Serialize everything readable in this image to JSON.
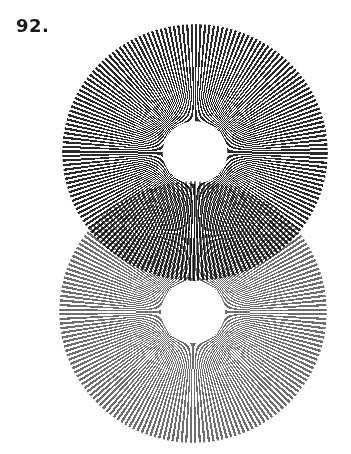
{
  "figure": {
    "number_label": "92.",
    "upper_disc": {
      "pattern": "radial-spokes",
      "spoke_count": 180,
      "color": "#2a2a2a",
      "center": [
        195,
        152
      ],
      "outer_radius": 131,
      "hole_radius": 31
    },
    "lower_disc": {
      "pattern": "radial-spokes",
      "spoke_count": 180,
      "color": "#6e6e6e",
      "center": [
        193,
        312
      ],
      "outer_radius": 132,
      "hole_radius": 31
    },
    "overlap_effect": "moire"
  }
}
